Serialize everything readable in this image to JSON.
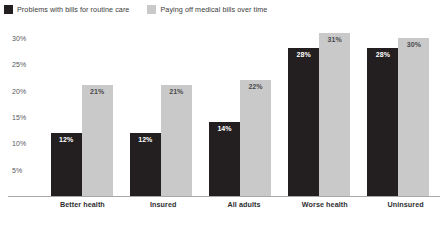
{
  "legend": {
    "position": "top-left",
    "items": [
      {
        "label": "Problems with bills for routine care",
        "color": "#231f20",
        "swatch_name": "legend-swatch-dark"
      },
      {
        "label": "Paying off medical bills over time",
        "color": "#c9c9c9",
        "swatch_name": "legend-swatch-light"
      }
    ]
  },
  "axis": {
    "yticks": [
      "5%",
      "10%",
      "15%",
      "20%",
      "25%",
      "30%"
    ],
    "ytick_values": [
      5,
      10,
      15,
      20,
      25,
      30
    ]
  },
  "chart_data": {
    "type": "bar",
    "title": "",
    "subtitle": "",
    "xlabel": "",
    "ylabel": "",
    "ylim": [
      0,
      33
    ],
    "grid": false,
    "legend_position": "top-left",
    "categories": [
      "Better health",
      "Insured",
      "All adults",
      "Worse health",
      "Uninsured"
    ],
    "series": [
      {
        "name": "Problems with bills for routine care",
        "color": "#231f20",
        "values": [
          12,
          12,
          14,
          28,
          28
        ],
        "labels": [
          "12%",
          "12%",
          "14%",
          "28%",
          "28%"
        ]
      },
      {
        "name": "Paying off medical bills over time",
        "color": "#c9c9c9",
        "values": [
          21,
          21,
          22,
          31,
          30
        ],
        "labels": [
          "21%",
          "21%",
          "22%",
          "31%",
          "30%"
        ]
      }
    ]
  }
}
